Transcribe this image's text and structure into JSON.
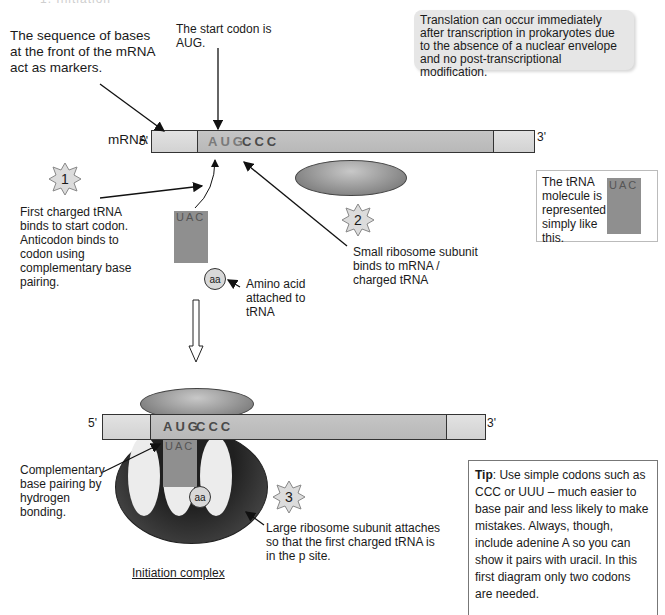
{
  "header": {
    "cut_off_text": "1.  Initiation"
  },
  "annotations": {
    "sequence_markers": "The sequence of bases at the front of the mRNA act as markers.",
    "start_codon": "The start codon is AUG.",
    "info_box": "Translation can occur immediately after transcription in prokaryotes due to the absence of a nuclear envelope and no post-transcriptional modification.",
    "mrna_label": "mRNA",
    "five_prime": "5'",
    "three_prime": "3'",
    "step1": "First charged tRNA binds to start codon. Anticodon binds to codon using complementary base pairing.",
    "step2": "Small ribosome subunit binds to mRNA / charged tRNA",
    "amino_acid": "Amino acid attached to tRNA",
    "legend": "The tRNA molecule is represented simply like this.",
    "complementary": "Complementary base pairing by hydrogen bonding.",
    "step3": "Large ribosome subunit attaches so that the first charged tRNA is in the p site.",
    "caption": "Initiation complex"
  },
  "steps": [
    {
      "number": "1"
    },
    {
      "number": "2"
    },
    {
      "number": "3"
    }
  ],
  "sequence": {
    "codon_start": "AUG",
    "codon_next": "CCC",
    "anticodon": "UAC",
    "amino_acid_abbrev": "aa"
  },
  "tip": {
    "label": "Tip",
    "text": ": Use simple codons such as CCC or UUU – much easier to base pair and less likely to make mistakes. Always, though, include adenine A so you can show it pairs with uracil. In this first diagram only two codons are needed."
  },
  "colors": {
    "mrna_light": "#dcdcdc",
    "mrna_dark": "#bfbfbf",
    "trna": "#8f8f8f",
    "large_subunit": "#2a2a2a",
    "info_box_bg": "#e6e6e6"
  }
}
